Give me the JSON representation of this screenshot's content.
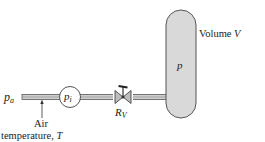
{
  "labels": {
    "inlet_pressure": "p",
    "inlet_pressure_sub": "a",
    "gauge_pressure": "p",
    "gauge_pressure_sub": "i",
    "valve_resistance": "R",
    "valve_resistance_sub": "V",
    "tank_pressure": "p",
    "volume": "Volume ",
    "volume_var": "V",
    "air_line1": "Air",
    "air_line2": "temperature, ",
    "air_var": "T"
  },
  "colors": {
    "pipe": "#9a9a9a",
    "tank_fill": "#d9d9d9",
    "stroke": "#444444"
  }
}
